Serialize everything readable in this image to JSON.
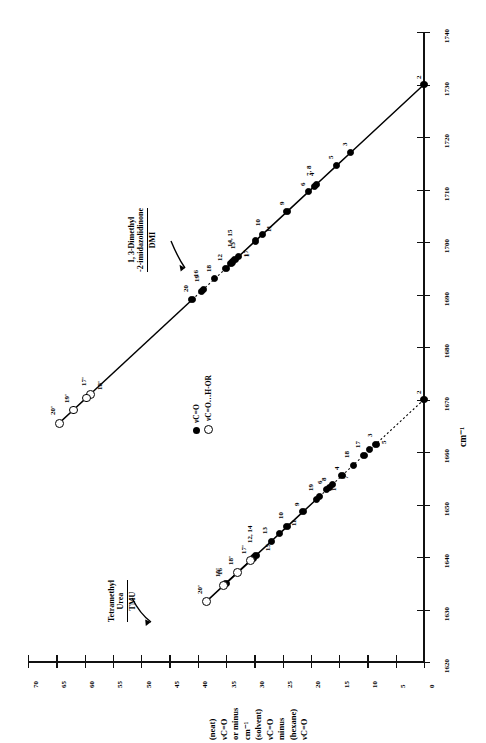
{
  "figure": {
    "orientation": "rotated-90",
    "x_axis_title": "cm⁻¹",
    "y_axis_title_lines": [
      "νC=O",
      "(hexane)",
      "minus",
      "νC=O",
      "(solvent)",
      "cm⁻¹",
      "or minus",
      "νC=O",
      "(neat)"
    ]
  },
  "legend": {
    "position": "center-left",
    "entries": [
      {
        "marker": "filled-circle",
        "label": "νC=O"
      },
      {
        "marker": "open-circle",
        "label": "νC=O…H-OR"
      }
    ]
  },
  "annotations": [
    {
      "id": "dmi",
      "line1": "1, 3-Dimethyl",
      "line2": "-2-imidazolidinone",
      "line3": "DMI",
      "arrow": true
    },
    {
      "id": "tmu",
      "line1": "Tetramethyl",
      "line2": "Urea",
      "line3": "TMU",
      "arrow": true
    }
  ],
  "chart_data": {
    "type": "scatter",
    "title": "",
    "xlabel": "cm⁻¹",
    "ylabel": "νC=O (hexane) minus νC=O (solvent) cm⁻¹ or minus νC=O (neat)",
    "xlim": [
      1620,
      1740
    ],
    "ylim": [
      0,
      70
    ],
    "xticks": [
      1620,
      1630,
      1640,
      1650,
      1660,
      1670,
      1680,
      1690,
      1700,
      1710,
      1720,
      1730,
      1740
    ],
    "yticks": [
      0,
      5,
      10,
      15,
      20,
      25,
      30,
      35,
      40,
      45,
      50,
      55,
      60,
      65,
      70
    ],
    "grid": false,
    "series": [
      {
        "name": "DMI",
        "marker": "filled-circle",
        "line": "solid",
        "points": [
          {
            "label": "2",
            "x": 1730.0,
            "y": 0.0
          },
          {
            "label": "3",
            "x": 1717.0,
            "y": 13.0
          },
          {
            "label": "5",
            "x": 1714.5,
            "y": 15.5
          },
          {
            "label": "4",
            "x": 1711.0,
            "y": 19.0
          },
          {
            "label": "7, 8",
            "x": 1710.6,
            "y": 19.4
          },
          {
            "label": "6",
            "x": 1709.6,
            "y": 20.4
          },
          {
            "label": "9",
            "x": 1705.8,
            "y": 24.2
          },
          {
            "label": "10",
            "x": 1701.5,
            "y": 28.5
          },
          {
            "label": "11",
            "x": 1700.2,
            "y": 29.8
          },
          {
            "label": "13",
            "x": 1697.2,
            "y": 32.8
          },
          {
            "label": "14, 15",
            "x": 1696.6,
            "y": 33.4
          },
          {
            "label": "1",
            "x": 1696.2,
            "y": 33.8
          },
          {
            "label": "17",
            "x": 1695.9,
            "y": 34.1
          },
          {
            "label": "12",
            "x": 1695.0,
            "y": 35.0
          },
          {
            "label": "18",
            "x": 1693.0,
            "y": 37.0
          },
          {
            "label": "19",
            "x": 1691.0,
            "y": 39.0
          },
          {
            "label": "16",
            "x": 1690.6,
            "y": 39.4
          },
          {
            "label": "20",
            "x": 1689.0,
            "y": 41.0
          }
        ]
      },
      {
        "name": "DMI-HOR",
        "marker": "open-circle",
        "line": "solid",
        "points": [
          {
            "label": "17'",
            "x": 1671.0,
            "y": 59.0
          },
          {
            "label": "18'",
            "x": 1670.3,
            "y": 59.7
          },
          {
            "label": "19'",
            "x": 1668.0,
            "y": 62.0
          },
          {
            "label": "20'",
            "x": 1665.5,
            "y": 64.5
          }
        ]
      },
      {
        "name": "TMU",
        "marker": "filled-circle",
        "line": "solid",
        "points": [
          {
            "label": "2",
            "x": 1670.0,
            "y": 0.0
          },
          {
            "label": "3",
            "x": 1661.5,
            "y": 8.5
          },
          {
            "label": "5",
            "x": 1660.4,
            "y": 9.6
          },
          {
            "label": "17",
            "x": 1659.4,
            "y": 10.6
          },
          {
            "label": "18",
            "x": 1657.5,
            "y": 12.5
          },
          {
            "label": "4",
            "x": 1655.5,
            "y": 14.5
          },
          {
            "label": "7",
            "x": 1653.8,
            "y": 16.2
          },
          {
            "label": "8",
            "x": 1653.3,
            "y": 16.7
          },
          {
            "label": "6",
            "x": 1652.8,
            "y": 17.2
          },
          {
            "label": "1",
            "x": 1651.6,
            "y": 18.4
          },
          {
            "label": "19",
            "x": 1651.0,
            "y": 19.0
          },
          {
            "label": "9",
            "x": 1648.6,
            "y": 21.4
          },
          {
            "label": "10",
            "x": 1645.8,
            "y": 24.2
          },
          {
            "label": "11",
            "x": 1644.4,
            "y": 25.6
          },
          {
            "label": "13",
            "x": 1643.0,
            "y": 27.0
          },
          {
            "label": "12, 14",
            "x": 1640.3,
            "y": 29.7
          },
          {
            "label": "15",
            "x": 1639.8,
            "y": 30.2
          },
          {
            "label": "16",
            "x": 1635.0,
            "y": 35.0
          }
        ]
      },
      {
        "name": "TMU-HOR",
        "marker": "open-circle",
        "line": "solid",
        "points": [
          {
            "label": "17'",
            "x": 1639.3,
            "y": 30.7
          },
          {
            "label": "18'",
            "x": 1637.0,
            "y": 33.0
          },
          {
            "label": "19'",
            "x": 1634.6,
            "y": 35.4
          },
          {
            "label": "20'",
            "x": 1631.5,
            "y": 38.5
          }
        ]
      }
    ]
  }
}
